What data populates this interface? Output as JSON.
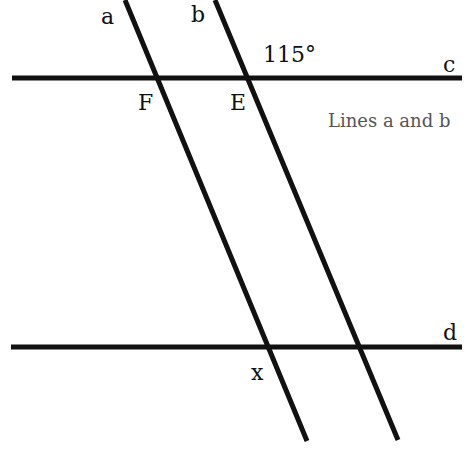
{
  "diagram": {
    "lines": {
      "a": {
        "label": "a",
        "x1": 125,
        "y1": 0,
        "x2": 307,
        "y2": 441
      },
      "b": {
        "label": "b",
        "x1": 215,
        "y1": 0,
        "x2": 398,
        "y2": 440
      },
      "c": {
        "label": "c",
        "x1": 12,
        "y1": 78,
        "x2": 462,
        "y2": 78
      },
      "d": {
        "label": "d",
        "x1": 11,
        "y1": 347,
        "x2": 462,
        "y2": 347
      }
    },
    "points": {
      "F": "F",
      "E": "E"
    },
    "angle_label": "115°",
    "unknown_label": "x",
    "caption": "Lines a and b",
    "colors": {
      "line": "#111111",
      "text": "#111111",
      "caption": "#555555"
    }
  }
}
